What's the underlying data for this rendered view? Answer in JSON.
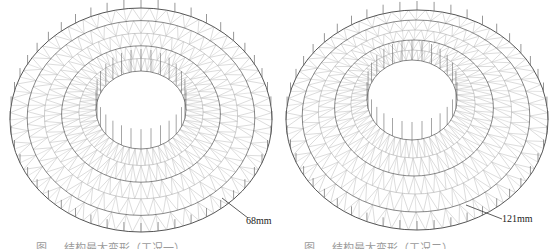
{
  "figures": [
    {
      "id": "left",
      "displacement_label": "68mm",
      "caption": "图 — 结构最大变形（工况一）",
      "geometry": {
        "cx": 141,
        "cy": 120,
        "outer_rx": 131,
        "outer_ry": 112,
        "inner_cx": 141,
        "inner_cy": 110,
        "inner_rx": 45,
        "inner_ry": 39,
        "rings": 5,
        "radial_members": 48,
        "inner_posts": 28,
        "inner_post_height": 22
      },
      "leader": {
        "x1": 222,
        "y1": 198,
        "x2": 248,
        "y2": 218
      },
      "label_pos": {
        "left": 246,
        "top": 215
      }
    },
    {
      "id": "right",
      "displacement_label": "121mm",
      "caption": "图 — 结构最大变形（工况二）",
      "geometry": {
        "cx": 137,
        "cy": 120,
        "outer_rx": 131,
        "outer_ry": 110,
        "inner_cx": 132,
        "inner_cy": 100,
        "inner_rx": 45,
        "inner_ry": 40,
        "rings": 5,
        "radial_members": 48,
        "inner_posts": 28,
        "inner_post_height": 20
      },
      "leader": {
        "x1": 186,
        "y1": 205,
        "x2": 222,
        "y2": 219
      },
      "label_pos": {
        "left": 222,
        "top": 213
      }
    }
  ],
  "colors": {
    "chord": "#555555",
    "web": "#b8b8b8",
    "post": "#6a6a6a",
    "leader": "#333333"
  }
}
